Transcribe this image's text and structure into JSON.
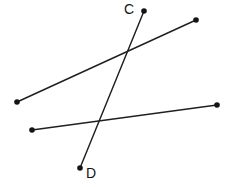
{
  "figure": {
    "kind": "geometry-line-diagram",
    "width": 230,
    "height": 187,
    "background_color": "#ffffff",
    "line_color": "#231f20",
    "dot_color": "#141414",
    "label_color": "#141414",
    "line_width": 1.45,
    "dot_radius": 2.8
  },
  "labels": {
    "c": "C",
    "d": "D"
  },
  "label_positions": {
    "c": {
      "x": 124,
      "y": 14
    },
    "d": {
      "x": 86,
      "y": 178
    }
  },
  "segments": [
    {
      "id": "segment-cd",
      "name": "segment-cd",
      "labelled": true,
      "from": {
        "name": "point-c",
        "label": "C",
        "x": 144,
        "y": 11
      },
      "to": {
        "name": "point-d",
        "label": "D",
        "x": 80,
        "y": 168
      }
    },
    {
      "id": "segment-upper",
      "name": "segment-upper",
      "labelled": false,
      "from": {
        "name": "point-upper-left",
        "label": "",
        "x": 17,
        "y": 102
      },
      "to": {
        "name": "point-upper-right",
        "label": "",
        "x": 196,
        "y": 20
      }
    },
    {
      "id": "segment-lower",
      "name": "segment-lower",
      "labelled": false,
      "from": {
        "name": "point-lower-left",
        "label": "",
        "x": 32,
        "y": 130
      },
      "to": {
        "name": "point-lower-right",
        "label": "",
        "x": 217,
        "y": 105
      }
    }
  ],
  "intersections": [
    {
      "name": "intersection-cd-upper",
      "x": 125,
      "y": 52
    },
    {
      "name": "intersection-cd-lower",
      "x": 98,
      "y": 123
    }
  ]
}
